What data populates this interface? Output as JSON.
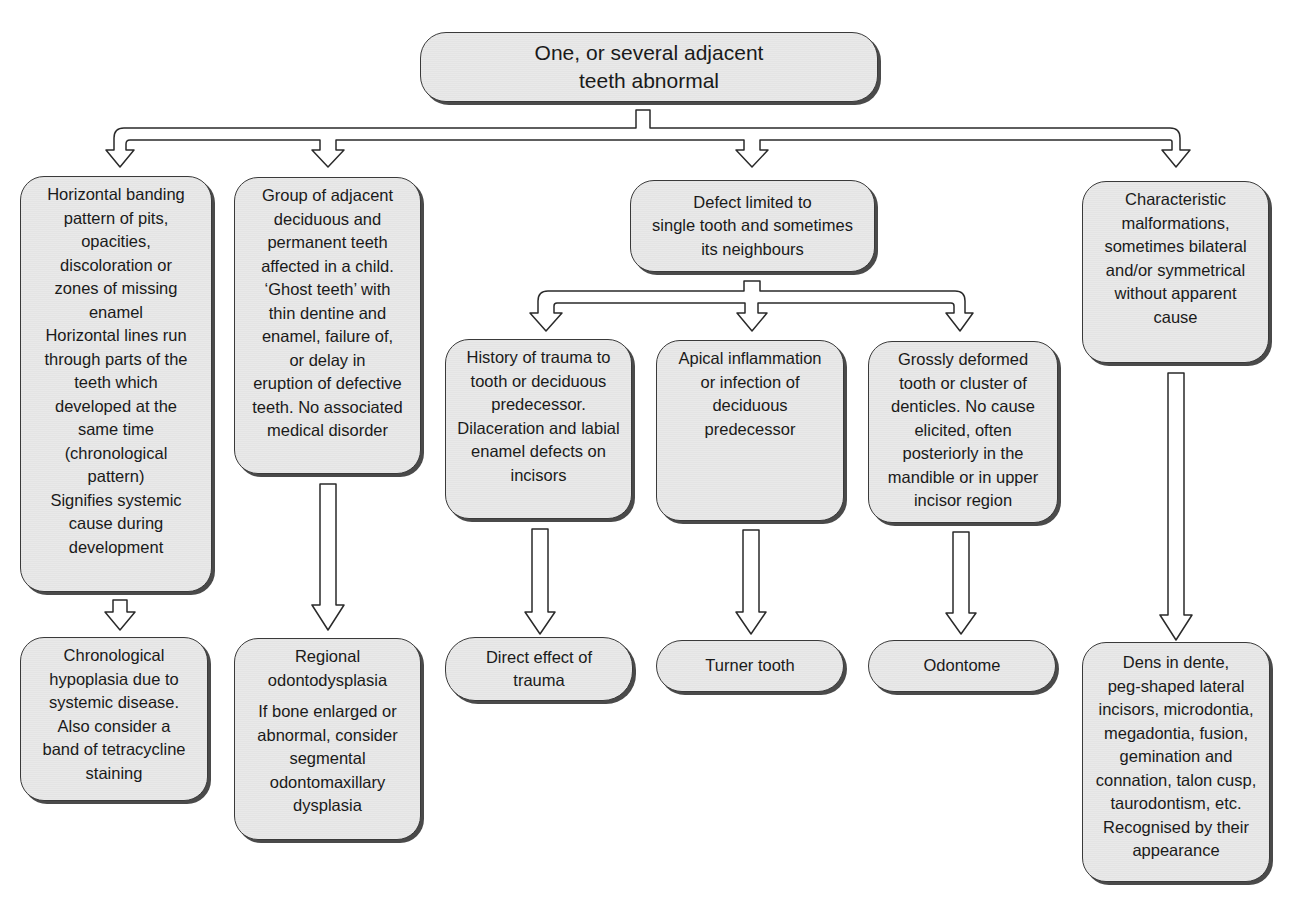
{
  "diagram": {
    "root": {
      "text": "One, or several adjacent\nteeth abnormal"
    },
    "level1": [
      {
        "id": "horizontal-banding",
        "text": "Horizontal banding\npattern of pits,\nopacities,\ndiscoloration or\nzones of missing\nenamel\nHorizontal lines run\nthrough parts of the\nteeth which\ndeveloped at the\nsame time\n(chronological\npattern)\nSignifies systemic\ncause during\ndevelopment"
      },
      {
        "id": "group-adjacent",
        "text": "Group of adjacent\ndeciduous and\npermanent teeth\naffected in a child.\n‘Ghost teeth’ with\nthin dentine and\nenamel, failure of,\nor delay in\neruption of defective\nteeth. No associated\nmedical disorder"
      },
      {
        "id": "single-tooth",
        "text": "Defect limited to\nsingle tooth and sometimes\nits neighbours"
      },
      {
        "id": "characteristic",
        "text": "Characteristic\nmalformations,\nsometimes bilateral\nand/or symmetrical\nwithout apparent\ncause"
      }
    ],
    "level2": [
      {
        "id": "trauma-history",
        "text": "History of trauma to\ntooth or deciduous\npredecessor.\nDilaceration and labial\nenamel defects on\nincisors"
      },
      {
        "id": "apical-inflammation",
        "text": "Apical inflammation\nor infection of\ndeciduous\npredecessor"
      },
      {
        "id": "grossly-deformed",
        "text": "Grossly deformed\ntooth or cluster of\ndenticles. No cause\nelicited, often\nposteriorly in the\nmandible or in upper\nincisor region"
      }
    ],
    "outcomes": [
      {
        "id": "chronological-hypoplasia",
        "text": "Chronological\nhypoplasia due to\nsystemic disease.\nAlso consider a\nband of tetracycline\nstaining"
      },
      {
        "id": "regional-odontodysplasia",
        "title": "Regional\nodontodysplasia",
        "note": "If bone enlarged or\nabnormal, consider\nsegmental\nodontomaxillary\ndysplasia"
      },
      {
        "id": "direct-trauma",
        "text": "Direct effect of\ntrauma"
      },
      {
        "id": "turner-tooth",
        "text": "Turner tooth"
      },
      {
        "id": "odontome",
        "text": "Odontome"
      },
      {
        "id": "dens-in-dente",
        "text": "Dens in dente,\npeg-shaped lateral\nincisors, microdontia,\nmegadontia, fusion,\ngemination and\nconnation, talon cusp,\ntaurodontism, etc.\nRecognised by their\nappearance"
      }
    ]
  }
}
